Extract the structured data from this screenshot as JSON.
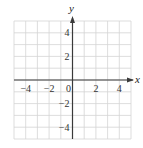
{
  "chart_data": {
    "type": "scatter",
    "title": "",
    "xlabel": "x",
    "ylabel": "y",
    "xlim": [
      -5,
      5
    ],
    "ylim": [
      -5,
      5
    ],
    "grid": true,
    "grid_step": 1,
    "x_ticks": [
      -4,
      -2,
      0,
      2,
      4
    ],
    "x_tick_labels": [
      "−4",
      "−2",
      "0",
      "2",
      "4"
    ],
    "y_ticks": [
      4,
      2,
      -2,
      -4
    ],
    "y_tick_labels": [
      "4",
      "2",
      "−2",
      "−4"
    ],
    "series": [],
    "legend": null
  },
  "colors": {
    "grid": "#d4d4d4",
    "axis": "#3a3a3a",
    "text": "#333333"
  }
}
